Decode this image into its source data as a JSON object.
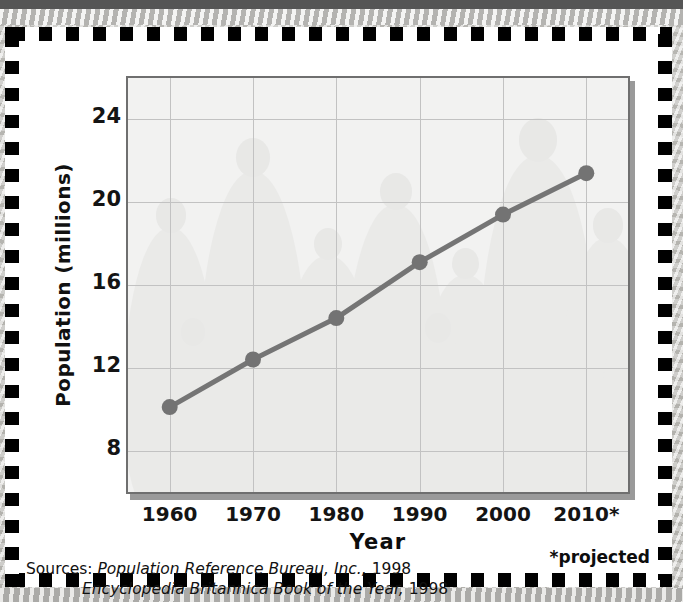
{
  "chart_data": {
    "type": "line",
    "title": "",
    "xlabel": "Year",
    "ylabel": "Population (millions)",
    "categories": [
      "1960",
      "1970",
      "1980",
      "1990",
      "2000",
      "2010*"
    ],
    "x": [
      1960,
      1970,
      1980,
      1990,
      2000,
      2010
    ],
    "values": [
      10.1,
      12.4,
      14.4,
      17.1,
      19.4,
      21.4
    ],
    "series": [
      {
        "name": "Population",
        "values": [
          10.1,
          12.4,
          14.4,
          17.1,
          19.4,
          21.4
        ]
      }
    ],
    "ylim": [
      6,
      26
    ],
    "yticks": [
      8,
      12,
      16,
      20,
      24
    ],
    "ytick_labels": [
      "8",
      "12",
      "16",
      "20",
      "24"
    ],
    "xlim": [
      1955,
      2015
    ],
    "grid": true,
    "legend": "none",
    "line_color": "#757575",
    "marker_color": "#737373",
    "plot_background": "#f2f2f1",
    "gridline_color": "#c2c2c2",
    "axis_color": "#6f6f6f"
  },
  "axes": {
    "y_label": "Population (millions)",
    "x_label": "Year",
    "y_ticks": [
      "24",
      "20",
      "16",
      "12",
      "8"
    ],
    "x_ticks": [
      "1960",
      "1970",
      "1980",
      "1990",
      "2000",
      "2010*"
    ]
  },
  "footnotes": {
    "sources_prefix": "Sources:",
    "source_1_title": "Population Reference Bureau, Inc.,",
    "source_1_year": " 1998",
    "source_2_title": "Encyclopedia Britannica Book of the Year,",
    "source_2_year": " 1998",
    "projected_note": "*projected"
  }
}
